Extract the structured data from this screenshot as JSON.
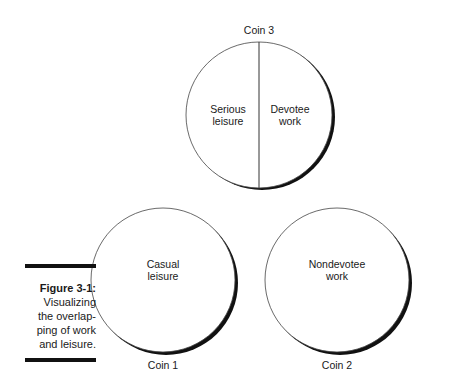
{
  "figure": {
    "number": "Figure 3-1:",
    "caption_lines": [
      "Visualizing",
      "the overlap-",
      "ping of work",
      "and leisure."
    ]
  },
  "coins": [
    {
      "label": "Coin 3",
      "sections": [
        {
          "line1": "Serious",
          "line2": "leisure"
        },
        {
          "line1": "Devotee",
          "line2": "work"
        }
      ]
    },
    {
      "label": "Coin 1",
      "sections": [
        {
          "line1": "Casual",
          "line2": "leisure"
        }
      ]
    },
    {
      "label": "Coin 2",
      "sections": [
        {
          "line1": "Nondevotee",
          "line2": "work"
        }
      ]
    }
  ],
  "colors": {
    "stroke": "#333333",
    "shadow": "#111111",
    "background": "#ffffff"
  }
}
